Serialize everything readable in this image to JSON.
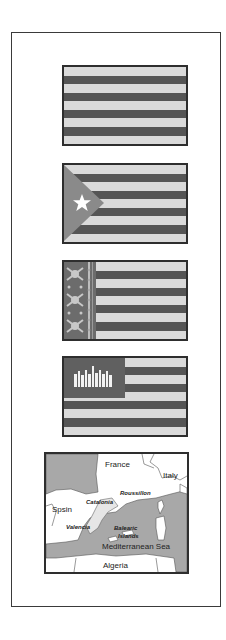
{
  "colors": {
    "stripe_light": "#dadada",
    "stripe_dark": "#555555",
    "border": "#2e2e2e",
    "triangle": "#8a8a8a",
    "map_gray": "#a8a8a8"
  },
  "flags": [
    {
      "id": "plain-stripes",
      "stripes": 9,
      "first_stripe": "light"
    },
    {
      "id": "triangle-star",
      "stripes": 9,
      "first_stripe": "light",
      "emblem": "white-star-on-triangle"
    },
    {
      "id": "ornamental-band",
      "stripes": 9,
      "first_stripe": "light",
      "emblem": "decorative-vertical-band"
    },
    {
      "id": "canton-emblem",
      "stripes": 9,
      "first_stripe": "light",
      "emblem": "white-bars-in-canton"
    }
  ],
  "map": {
    "labels": {
      "france": "France",
      "italy": "Italy",
      "spain": "Spsin",
      "catalonia": "Catalonia",
      "roussillon": "Roussillon",
      "valencia": "Valencia",
      "balearic": "Balearic",
      "islands": "Islands",
      "sea": "Mediterranean Sea",
      "algeria": "Algeria"
    }
  }
}
